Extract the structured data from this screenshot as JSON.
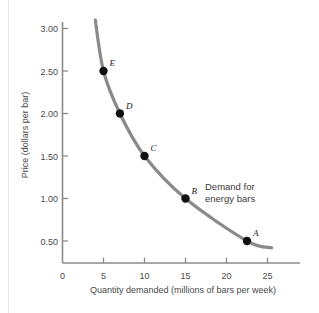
{
  "chart_data": {
    "type": "line",
    "title": "",
    "xlabel": "Quantity demanded (millions of bars per week)",
    "ylabel": "Price (dollars per bar)",
    "xlim": [
      0,
      27
    ],
    "ylim": [
      0,
      3.25
    ],
    "xticks": [
      "0",
      "5",
      "10",
      "15",
      "20",
      "25"
    ],
    "xtick_values": [
      0,
      5,
      10,
      15,
      20,
      25
    ],
    "yticks": [
      "0.50",
      "1.00",
      "1.50",
      "2.00",
      "2.50",
      "3.00"
    ],
    "ytick_values": [
      0.5,
      1.0,
      1.5,
      2.0,
      2.5,
      3.0
    ],
    "grid": false,
    "legend_position": "inside-right",
    "curve_color": "#8a8a8a",
    "point_color": "#111111",
    "axis_color": "#8a8a8a",
    "annotation": {
      "line1": "Demand for",
      "line2": "energy bars"
    },
    "series": [
      {
        "name": "Demand for energy bars",
        "x": [
          4.0,
          5.0,
          7.0,
          10.0,
          15.0,
          22.5,
          25.5
        ],
        "y": [
          3.1,
          2.5,
          2.0,
          1.5,
          1.0,
          0.5,
          0.42
        ]
      }
    ],
    "points": [
      {
        "label": "E",
        "x": 5.0,
        "y": 2.5
      },
      {
        "label": "D",
        "x": 7.0,
        "y": 2.0
      },
      {
        "label": "C",
        "x": 10.0,
        "y": 1.5
      },
      {
        "label": "B",
        "x": 15.0,
        "y": 1.0
      },
      {
        "label": "A",
        "x": 22.5,
        "y": 0.5
      }
    ]
  }
}
